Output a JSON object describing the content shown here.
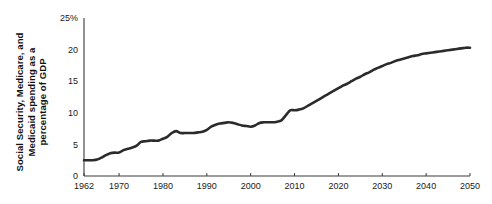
{
  "chart_data": {
    "type": "line",
    "title": "",
    "xlabel": "",
    "ylabel": "Social Security, Medicare, and Medicaid spending as a percentage of GDP",
    "ylabel_lines": [
      "Social Security, Medicare, and",
      "Medicaid spending as a",
      "percentage of GDP"
    ],
    "xlim": [
      1962,
      2050
    ],
    "ylim": [
      0,
      25
    ],
    "xticks": [
      1962,
      1970,
      1980,
      1990,
      2000,
      2010,
      2020,
      2030,
      2040,
      2050
    ],
    "xtick_labels": [
      "1962",
      "1970",
      "1980",
      "1990",
      "2000",
      "2010",
      "2020",
      "2030",
      "2040",
      "2050"
    ],
    "yticks": [
      0,
      5,
      10,
      15,
      20,
      25
    ],
    "ytick_labels": [
      "0",
      "5",
      "10",
      "15",
      "20",
      "25%"
    ],
    "grid": false,
    "legend": null,
    "line_color": "#2b2b2b",
    "line_width": 2.6,
    "series": [
      {
        "name": "Social Security, Medicare, and Medicaid spending",
        "x": [
          1962,
          1963,
          1964,
          1965,
          1966,
          1967,
          1968,
          1969,
          1970,
          1971,
          1972,
          1973,
          1974,
          1975,
          1976,
          1977,
          1978,
          1979,
          1980,
          1981,
          1982,
          1983,
          1984,
          1985,
          1986,
          1987,
          1988,
          1989,
          1990,
          1991,
          1992,
          1993,
          1994,
          1995,
          1996,
          1997,
          1998,
          1999,
          2000,
          2001,
          2002,
          2003,
          2004,
          2005,
          2006,
          2007,
          2008,
          2009,
          2010,
          2011,
          2012,
          2013,
          2014,
          2015,
          2016,
          2017,
          2018,
          2019,
          2020,
          2021,
          2022,
          2023,
          2024,
          2025,
          2026,
          2027,
          2028,
          2029,
          2030,
          2031,
          2032,
          2033,
          2034,
          2035,
          2036,
          2037,
          2038,
          2039,
          2040,
          2041,
          2042,
          2043,
          2044,
          2045,
          2046,
          2047,
          2048,
          2049,
          2050
        ],
        "y": [
          2.5,
          2.5,
          2.5,
          2.6,
          2.9,
          3.3,
          3.6,
          3.7,
          3.7,
          4.1,
          4.3,
          4.5,
          4.8,
          5.4,
          5.5,
          5.6,
          5.6,
          5.6,
          5.9,
          6.2,
          6.8,
          7.1,
          6.8,
          6.8,
          6.8,
          6.8,
          6.9,
          7.0,
          7.3,
          7.8,
          8.1,
          8.3,
          8.4,
          8.5,
          8.4,
          8.2,
          8.0,
          7.9,
          7.8,
          8.0,
          8.4,
          8.5,
          8.5,
          8.5,
          8.6,
          8.8,
          9.6,
          10.4,
          10.4,
          10.5,
          10.7,
          11.1,
          11.5,
          11.9,
          12.3,
          12.7,
          13.1,
          13.5,
          13.9,
          14.3,
          14.6,
          15.0,
          15.4,
          15.7,
          16.1,
          16.4,
          16.8,
          17.1,
          17.4,
          17.7,
          17.9,
          18.2,
          18.4,
          18.6,
          18.8,
          19.0,
          19.1,
          19.3,
          19.4,
          19.5,
          19.6,
          19.7,
          19.8,
          19.9,
          20.0,
          20.1,
          20.2,
          20.3,
          20.3
        ]
      }
    ]
  }
}
